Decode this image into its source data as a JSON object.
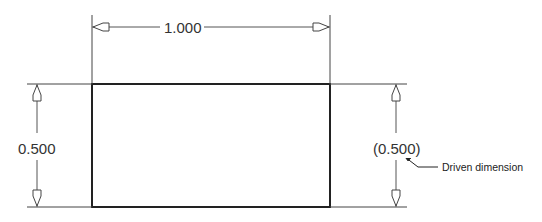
{
  "drawing": {
    "part_shape": "rectangle",
    "dimensions": {
      "width": {
        "label": "1.000",
        "orientation": "horizontal"
      },
      "height_left": {
        "label": "0.500",
        "orientation": "vertical"
      },
      "height_right": {
        "label": "(0.500)",
        "orientation": "vertical",
        "type": "driven"
      }
    },
    "annotation": {
      "text": "Driven dimension",
      "points_to": "height_right"
    },
    "colors": {
      "outline": "#222222",
      "dimension_line": "#555555",
      "text": "#333333"
    }
  }
}
